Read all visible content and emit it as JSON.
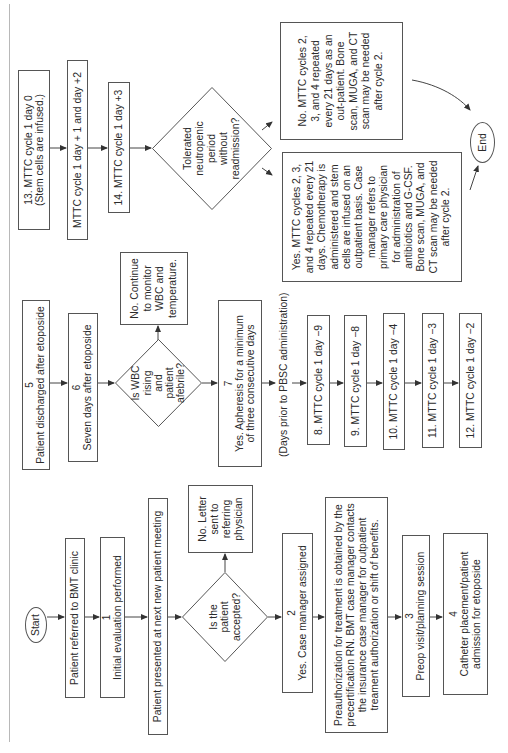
{
  "flowchart": {
    "start": "Start",
    "end": "End",
    "referred": "Patient referred to BMT clinic",
    "step1": {
      "num": "1",
      "text": "Initial evaluation performed"
    },
    "meeting": "Patient presented at next new patient meeting",
    "decision_accepted": "Is the patient accepted?",
    "no_letter": "No. Letter sent to referring physician",
    "step2": {
      "num": "2",
      "text": "Yes. Case manager assigned"
    },
    "preauth": "Preauthorization for treatment is obtained by the precertification RN. BMT case manager contacts the insurance case manager for outpatient treament authorization or shift of benefits.",
    "step3": {
      "num": "3",
      "text": "Preop visit/planning session"
    },
    "step4": {
      "num": "4",
      "text": "Catheter placement/patient admission for etoposide"
    },
    "step5": {
      "num": "5",
      "text": "Patient discharged after etoposide"
    },
    "step6": {
      "num": "6",
      "text": "Seven days after etoposide"
    },
    "decision_wbc": "Is WBC rising and patient afebrile?",
    "no_monitor": "No. Continue to monitor WBC and temperature.",
    "step7": {
      "num": "7",
      "text": "Yes. Apheresis for a minimum of three consecutive days"
    },
    "days_prior_label": "(Days prior to PBSC administration)",
    "step8": "8. MTTC cycle 1 day −9",
    "step9": "9. MTTC cycle 1 day −8",
    "step10": "10. MTTC cycle 1 day −4",
    "step11": "11. MTTC cycle 1 day −3",
    "step12": "12. MTTC cycle 1 day −2",
    "step13_line1": "13. MTTC cycle 1 day 0",
    "step13_line2": "(Stem cells are infused.)",
    "day_plus": "MTTC cycle 1 day + 1 and day +2",
    "step14": "14. MTTC cycle 1 day +3",
    "decision_neutropenic": "Tolerated neutropenic period without readmission?",
    "yes_outpatient": "Yes. MTTC cycles 2, 3, and 4 repeated every 21 days. Chemotherapy is administered and stem cells are infused on an outpatient basis. Case manager refers to primary care physician for administration of antibiotics and G-CSF. Bone scan, MUGA, and CT scan may be needed after cycle 2.",
    "no_outpatient": "No. MTTC cycles 2, 3, and 4 repeated every 21 days as an out-patient. Bone scan, MUGA, and CT scan may be needed after cycle 2."
  },
  "colors": {
    "stroke": "#555555",
    "text": "#2b2b2b",
    "border_line": "#b8b8b8"
  }
}
